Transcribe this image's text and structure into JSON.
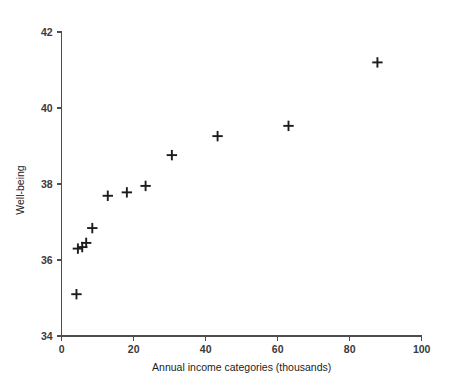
{
  "chart_data": {
    "type": "scatter",
    "title": "",
    "xlabel": "Annual income categories (thousands)",
    "ylabel": "Well-being",
    "xlim": [
      0,
      100
    ],
    "ylim": [
      34,
      42
    ],
    "xticks": [
      0,
      20,
      40,
      60,
      80,
      100
    ],
    "yticks": [
      34,
      36,
      38,
      40,
      42
    ],
    "xtick_labels": [
      "0",
      "20",
      "40",
      "60",
      "80",
      "100"
    ],
    "ytick_labels": [
      "34",
      "36",
      "38",
      "40",
      "42"
    ],
    "grid": false,
    "legend": null,
    "marker": "plus",
    "marker_color": "#1c1c1c",
    "axis_color": "#4d4d4d",
    "background": "#ffffff",
    "x": [
      4.1,
      4.5,
      5.7,
      6.8,
      8.5,
      12.8,
      18.1,
      23.3,
      30.6,
      43.3,
      63.0,
      87.7
    ],
    "y": [
      35.1,
      36.3,
      36.34,
      36.45,
      36.84,
      37.69,
      37.78,
      37.95,
      38.76,
      39.26,
      39.53,
      41.2
    ],
    "points": [
      {
        "x": 4.1,
        "y": 35.1
      },
      {
        "x": 4.5,
        "y": 36.3
      },
      {
        "x": 5.7,
        "y": 36.34
      },
      {
        "x": 6.8,
        "y": 36.45
      },
      {
        "x": 8.5,
        "y": 36.84
      },
      {
        "x": 12.8,
        "y": 37.69
      },
      {
        "x": 18.1,
        "y": 37.78
      },
      {
        "x": 23.3,
        "y": 37.95
      },
      {
        "x": 30.6,
        "y": 38.76
      },
      {
        "x": 43.3,
        "y": 39.26
      },
      {
        "x": 63.0,
        "y": 39.53
      },
      {
        "x": 87.7,
        "y": 41.2
      }
    ]
  },
  "geometry": {
    "plot_left": 61.7,
    "plot_right": 421.7,
    "plot_top": 32,
    "plot_bottom": 336,
    "marker_half": 5.2,
    "tick_len": 5,
    "xlabel_y": 371,
    "ylabel_x": 24,
    "ylabel_y": 190
  }
}
